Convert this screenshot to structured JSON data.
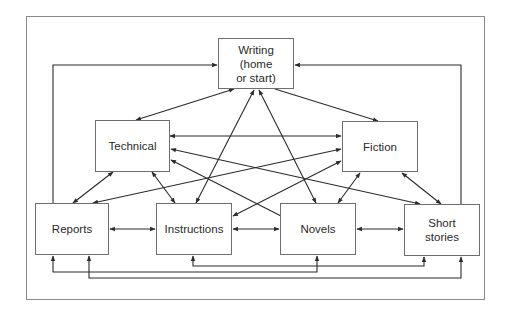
{
  "diagram": {
    "title": "",
    "nodes": [
      {
        "id": "writing",
        "label": "Writing\n(home\nor start)",
        "x": 218,
        "y": 38,
        "w": 76,
        "h": 51
      },
      {
        "id": "technical",
        "label": "Technical",
        "x": 95,
        "y": 120,
        "w": 75,
        "h": 52
      },
      {
        "id": "fiction",
        "label": "Fiction",
        "x": 342,
        "y": 121,
        "w": 76,
        "h": 51
      },
      {
        "id": "reports",
        "label": "Reports",
        "x": 35,
        "y": 203,
        "w": 74,
        "h": 52
      },
      {
        "id": "instructions",
        "label": "Instructions",
        "x": 156,
        "y": 203,
        "w": 76,
        "h": 52
      },
      {
        "id": "novels",
        "label": "Novels",
        "x": 280,
        "y": 203,
        "w": 76,
        "h": 52
      },
      {
        "id": "short_stories",
        "label": "Short\nstories",
        "x": 404,
        "y": 204,
        "w": 76,
        "h": 52
      }
    ],
    "edges": [
      {
        "from": "writing",
        "to": "technical",
        "type": "bidirectional"
      },
      {
        "from": "writing",
        "to": "fiction",
        "type": "directed"
      },
      {
        "from": "writing",
        "to": "instructions",
        "type": "bidirectional"
      },
      {
        "from": "writing",
        "to": "novels",
        "type": "bidirectional"
      },
      {
        "from": "reports",
        "to": "writing",
        "type": "directed",
        "route": "orthogonal-left"
      },
      {
        "from": "short_stories",
        "to": "writing",
        "type": "directed",
        "route": "orthogonal-right"
      },
      {
        "from": "technical",
        "to": "fiction",
        "type": "bidirectional"
      },
      {
        "from": "technical",
        "to": "short_stories",
        "type": "bidirectional"
      },
      {
        "from": "technical",
        "to": "novels",
        "type": "directed",
        "direction": "novels-to-technical"
      },
      {
        "from": "technical",
        "to": "reports",
        "type": "bidirectional"
      },
      {
        "from": "technical",
        "to": "instructions",
        "type": "bidirectional"
      },
      {
        "from": "fiction",
        "to": "reports",
        "type": "bidirectional"
      },
      {
        "from": "fiction",
        "to": "instructions",
        "type": "bidirectional"
      },
      {
        "from": "fiction",
        "to": "novels",
        "type": "bidirectional"
      },
      {
        "from": "fiction",
        "to": "short_stories",
        "type": "bidirectional"
      },
      {
        "from": "reports",
        "to": "instructions",
        "type": "bidirectional"
      },
      {
        "from": "instructions",
        "to": "novels",
        "type": "bidirectional"
      },
      {
        "from": "novels",
        "to": "short_stories",
        "type": "bidirectional"
      },
      {
        "from": "instructions",
        "to": "short_stories",
        "type": "bidirectional",
        "route": "bottom-bus"
      },
      {
        "from": "reports",
        "to": "novels",
        "type": "bidirectional",
        "route": "bottom-bus"
      },
      {
        "from": "reports",
        "to": "short_stories",
        "type": "bidirectional",
        "route": "bottom-bus"
      }
    ],
    "colors": {
      "line": "#2b2b2b",
      "box_border": "#6e6e6e",
      "frame": "#8a8a8a",
      "text": "#2a2a2a",
      "background": "#ffffff"
    }
  }
}
